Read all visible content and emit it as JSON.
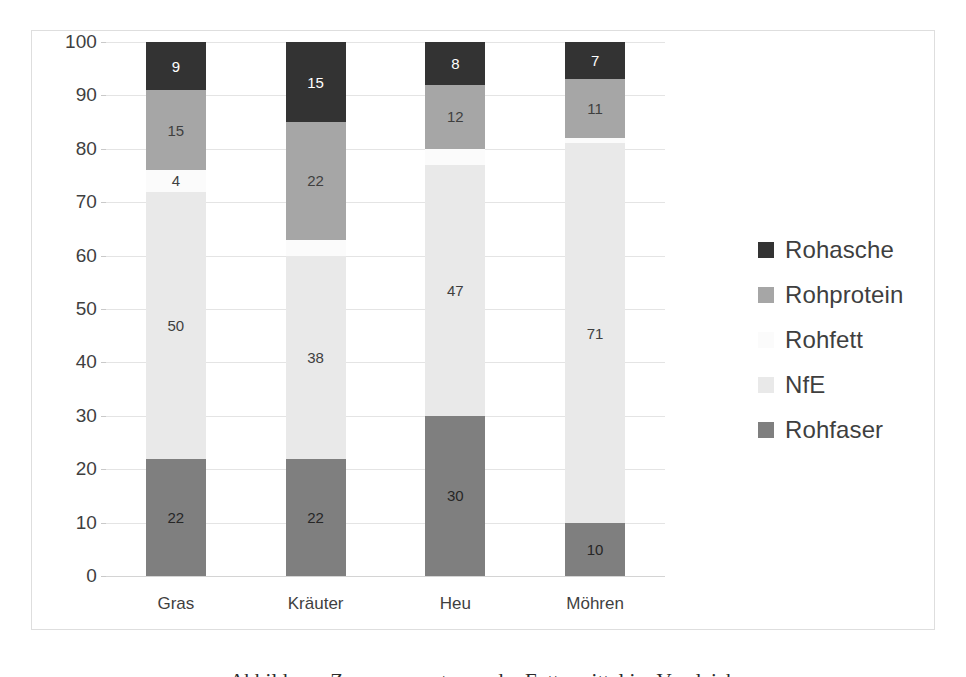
{
  "chart_data": {
    "type": "bar",
    "subtype": "stacked-100-percent",
    "title": "",
    "xlabel": "",
    "ylabel": "",
    "ylim": [
      0,
      100
    ],
    "ytick_step": 10,
    "yticks": [
      0,
      10,
      20,
      30,
      40,
      50,
      60,
      70,
      80,
      90,
      100
    ],
    "grid": true,
    "legend_position": "right",
    "categories": [
      "Gras",
      "Kräuter",
      "Heu",
      "Möhren"
    ],
    "stack_order_bottom_to_top": [
      "Rohfaser",
      "NfE",
      "Rohfett",
      "Rohprotein",
      "Rohasche"
    ],
    "series": [
      {
        "name": "Rohasche",
        "color": "#333333",
        "label_color": "#ffffff",
        "values": [
          9,
          15,
          8,
          7
        ]
      },
      {
        "name": "Rohprotein",
        "color": "#a6a6a6",
        "label_color": "#3f3f3f",
        "values": [
          15,
          22,
          12,
          11
        ]
      },
      {
        "name": "Rohfett",
        "color": "#fbfbfb",
        "label_color": "#3f3f3f",
        "values": [
          4,
          3,
          3,
          1
        ]
      },
      {
        "name": "NfE",
        "color": "#e9e9e9",
        "label_color": "#3f3f3f",
        "values": [
          50,
          38,
          47,
          71
        ]
      },
      {
        "name": "Rohfaser",
        "color": "#7f7f7f",
        "label_color": "#262626",
        "values": [
          22,
          22,
          30,
          10
        ]
      }
    ]
  },
  "axis": {
    "y_tick_labels": [
      "0",
      "10",
      "20",
      "30",
      "40",
      "50",
      "60",
      "70",
      "80",
      "90",
      "100"
    ]
  },
  "legend": {
    "items": [
      {
        "label": "Rohasche",
        "color": "#333333"
      },
      {
        "label": "Rohprotein",
        "color": "#a6a6a6"
      },
      {
        "label": "Rohfett",
        "color": "#fbfbfb"
      },
      {
        "label": "NfE",
        "color": "#e9e9e9"
      },
      {
        "label": "Rohfaser",
        "color": "#7f7f7f"
      }
    ]
  },
  "page": {
    "bottom_cutoff_text": "Abbildung: Zusammensetzung der Futtermittel im Vergleich"
  }
}
